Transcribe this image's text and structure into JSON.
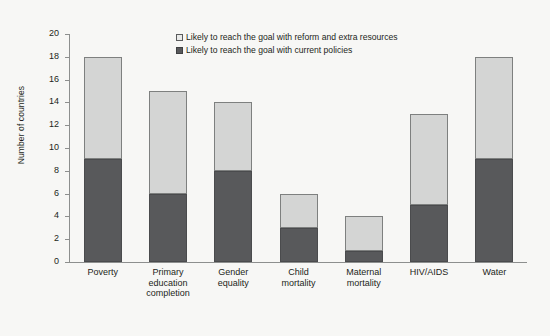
{
  "chart_data": {
    "type": "bar",
    "subtype": "stacked-vertical",
    "title": "",
    "xlabel": "",
    "ylabel": "Number of countries",
    "ylim": [
      0,
      20
    ],
    "yticks": [
      0,
      2,
      4,
      6,
      8,
      10,
      12,
      14,
      16,
      18,
      20
    ],
    "grid": false,
    "legend_position": "top-center",
    "categories": [
      "Poverty",
      "Primary education completion",
      "Gender equality",
      "Child mortality",
      "Maternal mortality",
      "HIV/AIDS",
      "Water"
    ],
    "category_lines": [
      [
        "Poverty"
      ],
      [
        "Primary",
        "education",
        "completion"
      ],
      [
        "Gender",
        "equality"
      ],
      [
        "Child",
        "mortality"
      ],
      [
        "Maternal",
        "mortality"
      ],
      [
        "HIV/AIDS"
      ],
      [
        "Water"
      ]
    ],
    "series": [
      {
        "name": "Likely to reach the goal with current policies",
        "color": "#58595b",
        "values": [
          9,
          6,
          8,
          3,
          1,
          5,
          9
        ]
      },
      {
        "name": "Likely to reach the goal with reform and extra resources",
        "color": "#d4d5d4",
        "values": [
          9,
          9,
          6,
          3,
          3,
          8,
          9
        ]
      }
    ],
    "totals": [
      18,
      15,
      14,
      6,
      4,
      13,
      18
    ]
  },
  "legend": {
    "items": [
      {
        "label": "Likely to reach the goal with reform and extra resources",
        "swatch": "light"
      },
      {
        "label": "Likely to reach the goal with current policies",
        "swatch": "dark"
      }
    ]
  },
  "colors": {
    "background": "#f7f7f5",
    "axis": "#8d8f8e",
    "text": "#231f20",
    "series_current_policies": "#58595b",
    "series_reform_resources": "#d4d5d4"
  }
}
